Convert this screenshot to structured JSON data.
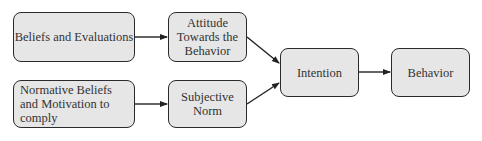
{
  "diagram": {
    "type": "flowchart",
    "nodes": [
      {
        "id": "beliefs",
        "label": "Beliefs and Evaluations"
      },
      {
        "id": "attitude",
        "label": "Attitude Towards the Behavior"
      },
      {
        "id": "normative",
        "label": "Normative Beliefs and Motivation to comply"
      },
      {
        "id": "subjective",
        "label": "Subjective Norm"
      },
      {
        "id": "intention",
        "label": "Intention"
      },
      {
        "id": "behavior",
        "label": "Behavior"
      }
    ],
    "edges": [
      {
        "from": "beliefs",
        "to": "attitude"
      },
      {
        "from": "normative",
        "to": "subjective"
      },
      {
        "from": "attitude",
        "to": "intention"
      },
      {
        "from": "subjective",
        "to": "intention"
      },
      {
        "from": "intention",
        "to": "behavior"
      }
    ],
    "colors": {
      "node_fill": "#e6e6e6",
      "border": "#2a2a2a",
      "text": "#333333"
    }
  }
}
